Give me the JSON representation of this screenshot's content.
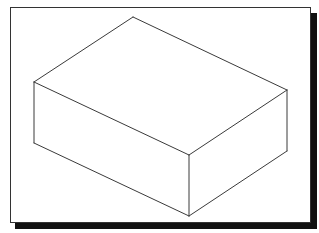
{
  "figure": {
    "colors": {
      "background": "#ffffff",
      "frame_border": "#333333",
      "shadow": "#111111",
      "edge_stroke": "#3a3a3a"
    },
    "box": {
      "vertices": {
        "top_back": [
          133,
          17
        ],
        "top_left": [
          34,
          82
        ],
        "top_right": [
          287,
          90
        ],
        "top_front": [
          189,
          155
        ],
        "bottom_left": [
          34,
          143
        ],
        "bottom_right": [
          287,
          151
        ],
        "bottom_front": [
          189,
          216
        ]
      },
      "edges": [
        {
          "name": "top-back-left-edge",
          "from": "top_back",
          "to": "top_left"
        },
        {
          "name": "top-back-right-edge",
          "from": "top_back",
          "to": "top_right"
        },
        {
          "name": "top-front-left-edge",
          "from": "top_left",
          "to": "top_front"
        },
        {
          "name": "top-front-right-edge",
          "from": "top_right",
          "to": "top_front"
        },
        {
          "name": "left-vertical-edge",
          "from": "top_left",
          "to": "bottom_left"
        },
        {
          "name": "right-vertical-edge",
          "from": "top_right",
          "to": "bottom_right"
        },
        {
          "name": "front-vertical-edge",
          "from": "top_front",
          "to": "bottom_front"
        },
        {
          "name": "bottom-front-left-edge",
          "from": "bottom_left",
          "to": "bottom_front"
        },
        {
          "name": "bottom-front-right-edge",
          "from": "bottom_right",
          "to": "bottom_front"
        }
      ]
    }
  }
}
